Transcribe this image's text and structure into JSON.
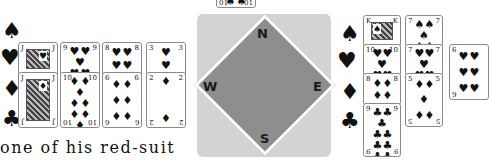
{
  "west_hand": {
    "suit_labels": [
      "♠",
      "♥",
      "♦",
      "♣"
    ],
    "spades": [],
    "hearts": [
      {
        "rank": "J",
        "suit": "♥",
        "face": true
      },
      {
        "rank": "9",
        "suit": "♥",
        "pips": 9
      },
      {
        "rank": "8",
        "suit": "♥",
        "pips": 8
      },
      {
        "rank": "3",
        "suit": "♥",
        "pips": 3
      }
    ],
    "diamonds": [
      {
        "rank": "J",
        "suit": "♦",
        "face": true
      },
      {
        "rank": "10",
        "suit": "♦",
        "pips": 10
      },
      {
        "rank": "6",
        "suit": "♦",
        "pips": 6
      },
      {
        "rank": "2",
        "suit": "♦",
        "pips": 2
      }
    ],
    "clubs": []
  },
  "north_card": {
    "rank": "10",
    "suit": "♠"
  },
  "compass": {
    "north": "N",
    "south": "S",
    "east": "E",
    "west": "W"
  },
  "east_hand": {
    "suit_labels": [
      "♠",
      "♥",
      "♦",
      "♣"
    ],
    "column1": [
      {
        "rank": "K",
        "suit": "♠",
        "face": true
      },
      {
        "rank": "10",
        "suit": "♥",
        "pips": 10
      },
      {
        "rank": "8",
        "suit": "♦",
        "pips": 8
      },
      {
        "rank": "9",
        "suit": "♣",
        "pips": 9
      }
    ],
    "column2": [
      {
        "rank": "7",
        "suit": "♠",
        "pips": 7
      },
      {
        "rank": "7",
        "suit": "♥",
        "pips": 7
      },
      {
        "rank": "5",
        "suit": "♦",
        "pips": 5
      }
    ],
    "column3": [
      {
        "rank": "6",
        "suit": "♥",
        "pips": 6
      }
    ]
  },
  "caption": "one of his red-suit"
}
